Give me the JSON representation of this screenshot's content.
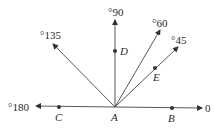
{
  "diagram": {
    "vertex": {
      "name": "A",
      "x": 115,
      "y": 107
    },
    "rays": [
      {
        "angle": "0",
        "label": "0",
        "end": [
          202,
          108
        ]
      },
      {
        "angle": "45",
        "label": "°45",
        "end": [
          178,
          47
        ]
      },
      {
        "angle": "60",
        "label": "°60",
        "end": [
          160,
          30
        ]
      },
      {
        "angle": "90",
        "label": "°90",
        "end": [
          115,
          20
        ]
      },
      {
        "angle": "135",
        "label": "°135",
        "end": [
          53,
          44
        ]
      },
      {
        "angle": "180",
        "label": "°180",
        "end": [
          36,
          106
        ]
      }
    ],
    "points": {
      "A": "A",
      "B": "B",
      "C": "C",
      "D": "D",
      "E": "E"
    }
  }
}
